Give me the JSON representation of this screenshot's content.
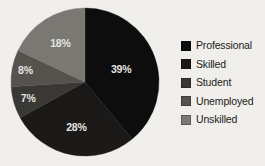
{
  "chart_data": {
    "type": "pie",
    "title": "",
    "subtitle": "",
    "xlabel": "",
    "ylabel": "",
    "grid": false,
    "legend_position": "right",
    "categories": [
      "Professional",
      "Skilled",
      "Student",
      "Unemployed",
      "Unskilled"
    ],
    "values": [
      39,
      28,
      7,
      8,
      18
    ],
    "value_labels": [
      "39%",
      "28%",
      "7%",
      "8%",
      "18%"
    ],
    "units": "percent",
    "total": 100,
    "start_angle_deg": 0,
    "direction": "clockwise",
    "colors": [
      "#0d0d0d",
      "#1c1a18",
      "#3b3936",
      "#57544f",
      "#7c7a74"
    ],
    "slices": [
      {
        "label": "Professional",
        "value": 39,
        "value_label": "39%",
        "color": "#0d0d0d"
      },
      {
        "label": "Skilled",
        "value": 28,
        "value_label": "28%",
        "color": "#1c1a18"
      },
      {
        "label": "Student",
        "value": 7,
        "value_label": "7%",
        "color": "#3b3936"
      },
      {
        "label": "Unemployed",
        "value": 8,
        "value_label": "8%",
        "color": "#57544f"
      },
      {
        "label": "Unskilled",
        "value": 18,
        "value_label": "18%",
        "color": "#7c7a74"
      }
    ]
  },
  "legend": {
    "items": [
      {
        "label": "Professional",
        "color": "#0d0d0d"
      },
      {
        "label": "Skilled",
        "color": "#1c1a18"
      },
      {
        "label": "Student",
        "color": "#3b3936"
      },
      {
        "label": "Unemployed",
        "color": "#57544f"
      },
      {
        "label": "Unskilled",
        "color": "#7c7a74"
      }
    ]
  },
  "figure": {
    "background": "#f4f2ee",
    "center_x": 85,
    "center_y": 82,
    "radius": 74
  }
}
